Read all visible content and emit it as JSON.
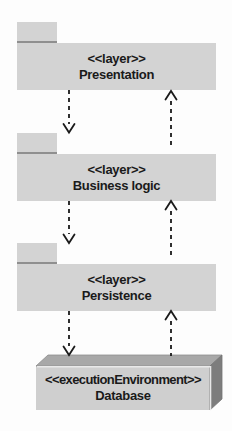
{
  "diagram_title": "Layered architecture deployment diagram",
  "layers": [
    {
      "stereotype": "<<layer>>",
      "name": "Presentation"
    },
    {
      "stereotype": "<<layer>>",
      "name": "Business logic"
    },
    {
      "stereotype": "<<layer>>",
      "name": "Persistence"
    }
  ],
  "node": {
    "stereotype": "<<executionEnvironment>>",
    "name": "Database"
  },
  "arrows": [
    {
      "from": "Presentation",
      "to": "Business logic",
      "direction": "down",
      "style": "dashed-open-arrow"
    },
    {
      "from": "Business logic",
      "to": "Presentation",
      "direction": "up",
      "style": "dashed-open-arrow"
    },
    {
      "from": "Business logic",
      "to": "Persistence",
      "direction": "down",
      "style": "dashed-open-arrow"
    },
    {
      "from": "Persistence",
      "to": "Business logic",
      "direction": "up",
      "style": "dashed-open-arrow"
    },
    {
      "from": "Persistence",
      "to": "Database",
      "direction": "down",
      "style": "dashed-open-arrow"
    },
    {
      "from": "Database",
      "to": "Persistence",
      "direction": "up",
      "style": "dashed-open-arrow"
    }
  ],
  "colors": {
    "package_fill": "#d3d3d3",
    "tab_underline": "#8f8f8f",
    "node_front": "#cfcfcf",
    "node_top": "#a8a8a8",
    "node_side": "#7d7d7d",
    "line": "#1a1a1a"
  }
}
